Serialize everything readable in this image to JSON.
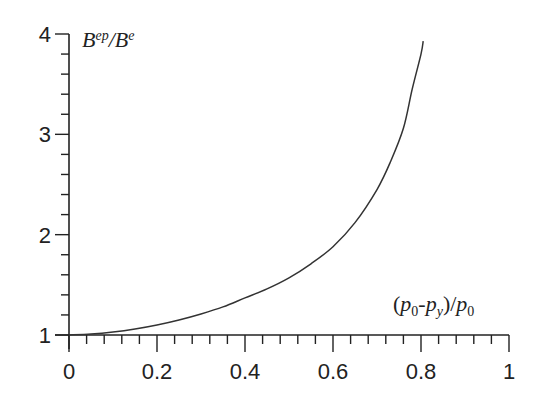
{
  "chart_data": {
    "type": "line",
    "title": "",
    "xlabel": "(p0-py)/p0",
    "ylabel": "Bep/Be",
    "xlim": [
      0,
      1
    ],
    "ylim": [
      1,
      4
    ],
    "grid": false,
    "legend": null,
    "x_ticks": [
      "0",
      "0.2",
      "0.4",
      "0.6",
      "0.8",
      "1"
    ],
    "y_ticks": [
      "1",
      "2",
      "3",
      "4"
    ],
    "x_minor_step": 0.04,
    "y_minor_step": 0.2,
    "series": [
      {
        "name": "Bep/Be",
        "x": [
          0,
          0.05,
          0.1,
          0.15,
          0.2,
          0.25,
          0.3,
          0.35,
          0.4,
          0.45,
          0.5,
          0.55,
          0.6,
          0.65,
          0.7,
          0.73,
          0.76,
          0.78,
          0.8,
          0.805
        ],
        "values": [
          1.0,
          1.01,
          1.03,
          1.06,
          1.1,
          1.15,
          1.21,
          1.28,
          1.37,
          1.46,
          1.57,
          1.71,
          1.88,
          2.12,
          2.45,
          2.72,
          3.06,
          3.45,
          3.8,
          3.93
        ]
      }
    ]
  },
  "labels": {
    "y_axis": {
      "base": "B",
      "sup_num": "ep",
      "slash": "/",
      "base2": "B",
      "sup_den": "e"
    },
    "x_axis": {
      "open": "(",
      "p1": "p",
      "sub1": "0",
      "dash": "-",
      "p2": "p",
      "sub2": "y",
      "close": ")/",
      "p3": "p",
      "sub3": "0"
    }
  },
  "colors": {
    "axis": "#222222",
    "curve": "#333333",
    "background": "#ffffff"
  }
}
